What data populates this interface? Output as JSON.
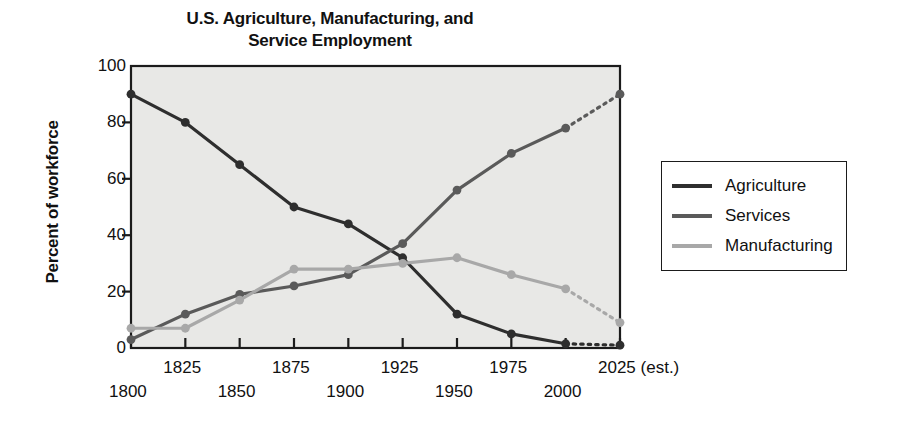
{
  "chart_data": {
    "type": "line",
    "title": "U.S. Agriculture, Manufacturing, and\nService Employment",
    "xlabel": "",
    "ylabel": "Percent of workforce",
    "ylim": [
      0,
      100
    ],
    "xlim": [
      1800,
      2025
    ],
    "yticks": [
      100,
      80,
      60,
      40,
      20,
      0
    ],
    "grid": false,
    "legend_position": "right",
    "x": [
      1800,
      1825,
      1850,
      1875,
      1900,
      1925,
      1950,
      1975,
      2000,
      2025
    ],
    "xtick_labels": [
      "1800",
      "1825",
      "1850",
      "1875",
      "1900",
      "1925",
      "1950",
      "1975",
      "2000",
      "2025 (est.)"
    ],
    "projection_note": "2025 values are estimates; final segment of each series is drawn dotted",
    "series": [
      {
        "name": "Agriculture",
        "color": "#2e2e2e",
        "values": [
          3,
          12,
          19,
          22,
          26,
          37,
          56,
          69,
          78,
          90
        ]
      },
      {
        "name": "Services",
        "color": "#5a5a5a",
        "values": [
          90,
          80,
          65,
          50,
          44,
          32,
          12,
          5,
          1.5,
          1
        ]
      },
      {
        "name": "Manufacturing",
        "color": "#a8a8a8",
        "values": [
          7,
          7,
          17,
          28,
          28,
          30,
          32,
          26,
          21,
          9
        ]
      }
    ],
    "plotted_series": [
      {
        "key": "agriculture",
        "legend_label": "Agriculture",
        "color": "#2e2e2e",
        "values": [
          90,
          80,
          65,
          50,
          44,
          32,
          12,
          5,
          1.5,
          1
        ]
      },
      {
        "key": "services",
        "legend_label": "Services",
        "color": "#5a5a5a",
        "values": [
          3,
          12,
          19,
          22,
          26,
          37,
          56,
          69,
          78,
          90
        ]
      },
      {
        "key": "manufacturing",
        "legend_label": "Manufacturing",
        "color": "#a8a8a8",
        "values": [
          7,
          7,
          17,
          28,
          28,
          30,
          32,
          26,
          21,
          9
        ]
      }
    ]
  },
  "title": {
    "line1": "U.S. Agriculture, Manufacturing, and",
    "line2": "Service Employment",
    "full": "U.S. Agriculture, Manufacturing, and Service Employment"
  },
  "axes": {
    "y_label": "Percent of workforce",
    "y_ticks": [
      "100",
      "80",
      "60",
      "40",
      "20",
      "0"
    ],
    "x_ticks": [
      "1800",
      "1825",
      "1850",
      "1875",
      "1900",
      "1925",
      "1950",
      "1975",
      "2000",
      "2025 (est.)"
    ]
  },
  "legend": {
    "items": [
      {
        "label": "Agriculture",
        "color": "#2e2e2e"
      },
      {
        "label": "Services",
        "color": "#5a5a5a"
      },
      {
        "label": "Manufacturing",
        "color": "#a8a8a8"
      }
    ]
  },
  "colors": {
    "plot_background": "#e8e8e6",
    "page_background": "#ffffff",
    "axis": "#1b1b1b",
    "agriculture": "#2e2e2e",
    "services": "#5a5a5a",
    "manufacturing": "#a8a8a8"
  }
}
